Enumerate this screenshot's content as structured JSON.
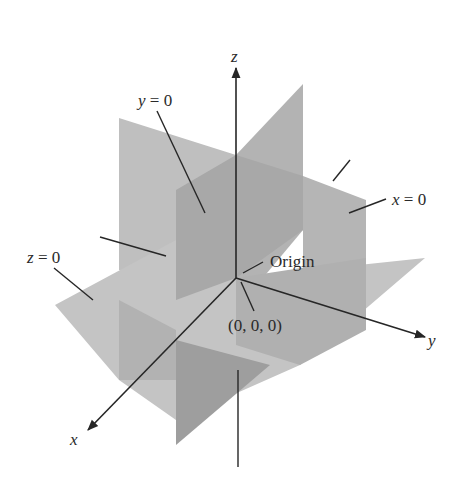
{
  "figure": {
    "colors": {
      "background": "#ffffff",
      "plane_light": "#bdbdbd",
      "plane_mid": "#a9a9a9",
      "plane_dark": "#9a9a9a",
      "line": "#262626"
    },
    "axes": {
      "x": {
        "label": "x"
      },
      "y": {
        "label": "y"
      },
      "z": {
        "label": "z"
      }
    },
    "planes": [
      {
        "id": "y0",
        "label_var": "y",
        "label_eq": "= 0"
      },
      {
        "id": "x0",
        "label_var": "x",
        "label_eq": "= 0"
      },
      {
        "id": "z0",
        "label_var": "z",
        "label_eq": "= 0"
      }
    ],
    "origin": {
      "label": "Origin",
      "coords": "(0, 0, 0)"
    }
  }
}
